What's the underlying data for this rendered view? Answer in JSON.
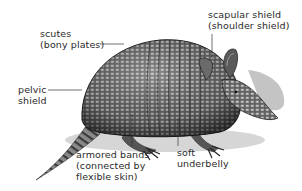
{
  "diagram": {
    "labels": [
      {
        "id": "scutes",
        "lines": [
          "scutes",
          "(bony plates)"
        ]
      },
      {
        "id": "scapular-shield",
        "lines": [
          "scapular shield",
          "(shoulder shield)"
        ]
      },
      {
        "id": "pelvic-shield",
        "lines": [
          "pelvic",
          "shield"
        ]
      },
      {
        "id": "armored-bands",
        "lines": [
          "armored bands",
          "(connected by",
          "flexible skin)"
        ]
      },
      {
        "id": "soft-underbelly",
        "lines": [
          "soft",
          "underbelly"
        ]
      }
    ],
    "colors": {
      "text": "#2a2a2a",
      "leader": "#333333",
      "shell_dark": "#2e2e2e",
      "shell_mid": "#6a6a6a",
      "shadow": "#bdbdbd"
    }
  }
}
